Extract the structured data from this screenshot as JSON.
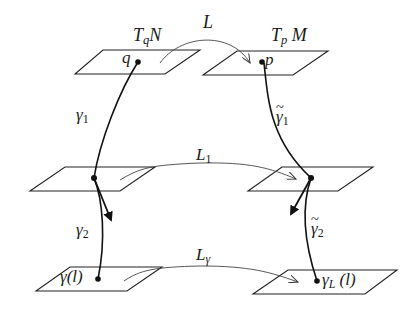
{
  "diagram": {
    "planes": [
      {
        "id": "tqn",
        "label": "T_qN",
        "point_label": "q"
      },
      {
        "id": "tpm",
        "label": "T_pM",
        "point_label": "p"
      },
      {
        "id": "mid-left",
        "label": ""
      },
      {
        "id": "mid-right",
        "label": ""
      },
      {
        "id": "bottom-left",
        "point_label": "γ(l)"
      },
      {
        "id": "bottom-right",
        "point_label": "γ_L (l)"
      }
    ],
    "maps": {
      "top": "L",
      "middle_main": "L",
      "middle_sub": "1",
      "bottom_main": "L",
      "bottom_sub": "γ"
    },
    "curves": {
      "left_upper": {
        "base": "γ",
        "sub": "1"
      },
      "left_lower": {
        "base": "γ",
        "sub": "2"
      },
      "right_upper": {
        "base": "γ",
        "sub": "1",
        "accent": "~"
      },
      "right_lower": {
        "base": "γ",
        "sub": "2",
        "accent": "~"
      }
    },
    "labels": {
      "tqn_main": "T",
      "tqn_sub": "q",
      "tqn_tail": "N",
      "tpm_main": "T",
      "tpm_sub": "p",
      "tpm_tail": "M",
      "q": "q",
      "p": "p",
      "gamma_l": "γ(l)",
      "gammaL_main": "γ",
      "gammaL_sub": "L",
      "gammaL_tail": "(l)"
    },
    "colors": {
      "stroke": "#1a1a1a",
      "light_stroke": "#555555",
      "background": "#ffffff"
    }
  }
}
